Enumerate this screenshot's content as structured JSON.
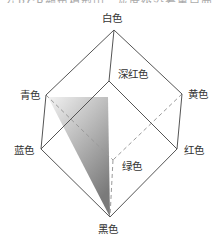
{
  "diagram": {
    "top_cut_text": "在RGB颜色模型中，灰度级沿着黑白两点的连线分布",
    "vertices": {
      "white": {
        "label": "白色",
        "x": 114,
        "y": 30
      },
      "magenta": {
        "label": "深红色",
        "x": 109,
        "y": 81
      },
      "cyan": {
        "label": "青色",
        "x": 46,
        "y": 95
      },
      "yellow": {
        "label": "黄色",
        "x": 182,
        "y": 94
      },
      "blue": {
        "label": "蓝色",
        "x": 41,
        "y": 149
      },
      "red": {
        "label": "红色",
        "x": 177,
        "y": 149
      },
      "green": {
        "label": "绿色",
        "x": 113,
        "y": 160
      },
      "black": {
        "label": "黑色",
        "x": 110,
        "y": 217
      }
    },
    "solid_edges": [
      [
        "white",
        "cyan"
      ],
      [
        "white",
        "magenta"
      ],
      [
        "white",
        "yellow"
      ],
      [
        "cyan",
        "blue"
      ],
      [
        "magenta",
        "blue"
      ],
      [
        "magenta",
        "red"
      ],
      [
        "yellow",
        "red"
      ],
      [
        "blue",
        "black"
      ],
      [
        "red",
        "black"
      ]
    ],
    "dashed_edges": [
      [
        "cyan",
        "green"
      ],
      [
        "yellow",
        "green"
      ],
      [
        "green",
        "black"
      ]
    ],
    "gray_triangle": {
      "points": [
        [
          48,
          97
        ],
        [
          108,
          97
        ],
        [
          110,
          217
        ]
      ],
      "from_color": "#f0f0f0",
      "to_color": "#7a7a7a"
    },
    "colors": {
      "edge": "#555555",
      "dashed": "#9a9a9a",
      "text": "#333333"
    }
  }
}
